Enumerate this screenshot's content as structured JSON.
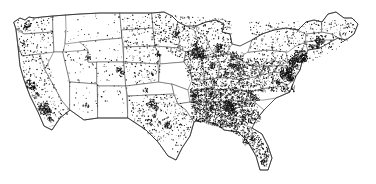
{
  "figure": {
    "kind": "choropleth-dot-density",
    "has_visible_text": false,
    "background_color": "#ffffff",
    "dot_color": "#111111",
    "state_border_color": "#4a4a4a",
    "nation_border_color": "#222222",
    "width_px": 376,
    "height_px": 184
  },
  "chart_data": {
    "type": "scatter",
    "title": "",
    "subtitle": "",
    "xlabel": "",
    "ylabel": "",
    "legend": [],
    "annotations": [],
    "grid": false,
    "projection": "albers-usa-approximate",
    "xlim": [
      13,
      369
    ],
    "ylim": [
      12,
      172
    ],
    "regions": [
      {
        "name": "Pacific Northwest",
        "density": "low-with-clusters",
        "clusters": [
          "Puget Sound",
          "Portland"
        ]
      },
      {
        "name": "California",
        "density": "low-with-clusters",
        "clusters": [
          "San Francisco Bay",
          "Los Angeles",
          "San Diego",
          "Central Valley"
        ]
      },
      {
        "name": "Mountain West",
        "density": "very-low",
        "clusters": [
          "Salt Lake City",
          "Denver Front Range",
          "Phoenix"
        ]
      },
      {
        "name": "Great Plains",
        "density": "low",
        "clusters": [
          "Omaha",
          "Wichita",
          "Oklahoma City"
        ]
      },
      {
        "name": "Texas",
        "density": "moderate",
        "clusters": [
          "Dallas-Fort Worth",
          "Houston",
          "San Antonio",
          "Austin"
        ]
      },
      {
        "name": "Upper Midwest",
        "density": "moderate-high",
        "clusters": [
          "Minneapolis",
          "Chicago",
          "Milwaukee",
          "Detroit"
        ]
      },
      {
        "name": "Ohio Valley",
        "density": "high",
        "clusters": [
          "Cleveland",
          "Columbus",
          "Cincinnati",
          "Indianapolis",
          "Louisville"
        ]
      },
      {
        "name": "Southeast",
        "density": "very-high",
        "clusters": [
          "Atlanta",
          "Birmingham",
          "Charlotte",
          "Nashville",
          "Memphis"
        ]
      },
      {
        "name": "Mid-Atlantic",
        "density": "very-high",
        "clusters": [
          "Washington DC",
          "Baltimore",
          "Philadelphia",
          "Richmond"
        ]
      },
      {
        "name": "Northeast",
        "density": "high",
        "clusters": [
          "New York",
          "Boston",
          "Hartford",
          "Providence"
        ]
      },
      {
        "name": "Florida",
        "density": "moderate-high",
        "clusters": [
          "Jacksonville",
          "Orlando",
          "Tampa",
          "Miami"
        ]
      }
    ],
    "dot_counts_by_region": {
      "Pacific Northwest": 120,
      "California": 210,
      "Mountain West": 150,
      "Great Plains": 230,
      "Texas": 320,
      "Upper Midwest": 520,
      "Ohio Valley": 700,
      "Southeast": 1500,
      "Mid-Atlantic": 780,
      "Northeast": 420,
      "Florida": 300
    }
  }
}
